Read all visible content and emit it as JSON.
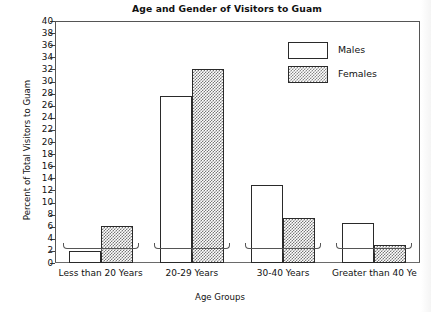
{
  "chart_data": {
    "type": "bar",
    "title": "Age and Gender of Visitors to Guam",
    "xlabel": "Age Groups",
    "ylabel": "Percent of Total Visitors to Guam",
    "categories": [
      "Less than 20 Years",
      "20-29 Years",
      "30-40 Years",
      "Greater than 40 Ye"
    ],
    "series": [
      {
        "name": "Males",
        "values": [
          2.0,
          27.6,
          12.9,
          6.6
        ]
      },
      {
        "name": "Females",
        "values": [
          6.2,
          32.0,
          7.4,
          3.0
        ]
      }
    ],
    "ylim": [
      0,
      40
    ],
    "ytick_step": 2,
    "yticks": [
      0,
      2,
      4,
      6,
      8,
      10,
      12,
      14,
      16,
      18,
      20,
      22,
      24,
      26,
      28,
      30,
      32,
      34,
      36,
      38,
      40
    ],
    "grid": false,
    "legend_position": "upper-right-inside",
    "legend": [
      {
        "label": "Males",
        "fill": "white"
      },
      {
        "label": "Females",
        "fill": "gray-dither"
      }
    ],
    "colors": {
      "males_fill": "#ffffff",
      "females_fill": "#808080",
      "bar_outline": "#2a2a2a",
      "axis": "#555555",
      "text": "#111111",
      "background": "#ffffff"
    }
  }
}
